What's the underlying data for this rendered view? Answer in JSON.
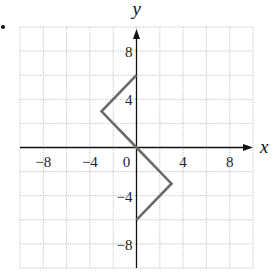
{
  "chart_data": {
    "type": "line",
    "title": "",
    "xlabel": "x",
    "ylabel": "y",
    "xlim": [
      -10,
      10
    ],
    "ylim": [
      -10,
      10
    ],
    "grid": true,
    "grid_step": 2,
    "legend": null,
    "x_ticks": [
      {
        "value": -8,
        "label": "−8"
      },
      {
        "value": -4,
        "label": "−4"
      },
      {
        "value": 0,
        "label": "0"
      },
      {
        "value": 4,
        "label": "4"
      },
      {
        "value": 8,
        "label": "8"
      }
    ],
    "y_ticks": [
      {
        "value": 8,
        "label": "8"
      },
      {
        "value": 4,
        "label": "4"
      },
      {
        "value": -4,
        "label": "−4"
      },
      {
        "value": -8,
        "label": "−8"
      }
    ],
    "series": [
      {
        "name": "polyline",
        "points": [
          {
            "x": 0,
            "y": 6
          },
          {
            "x": -3,
            "y": 3
          },
          {
            "x": 0,
            "y": 0
          },
          {
            "x": 3,
            "y": -3
          },
          {
            "x": 0,
            "y": -6
          }
        ],
        "color": "#6b6b6b"
      }
    ]
  },
  "layout": {
    "plot_left": 20,
    "plot_right": 253,
    "plot_top": 27,
    "plot_bottom": 268,
    "origin_x": 137,
    "origin_y": 147
  },
  "colors": {
    "grid": "#bdbdbd",
    "axis": "#111111",
    "bullet": "#111111"
  },
  "bullet": {
    "x": 3,
    "y": 27
  }
}
